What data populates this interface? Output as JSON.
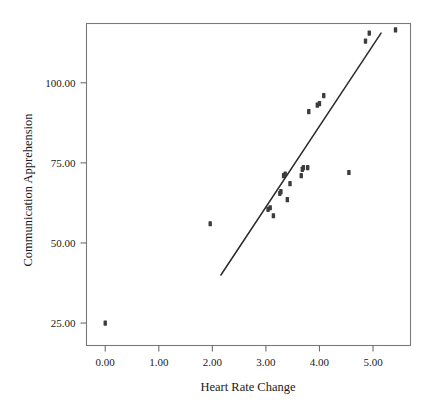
{
  "chart_data": {
    "type": "scatter",
    "title": "",
    "xlabel": "Heart Rate Change",
    "ylabel": "Communication Apprehension",
    "xlim": [
      -0.35,
      5.7
    ],
    "ylim": [
      18.0,
      118.5
    ],
    "xticks": [
      0,
      1,
      2,
      3,
      4,
      5
    ],
    "xticklabels": [
      "0.00",
      "1.00",
      "2.00",
      "3.00",
      "4.00",
      "5.00"
    ],
    "yticks": [
      25,
      50,
      75,
      100
    ],
    "yticklabels": [
      "25.00",
      "50.00",
      "75.00",
      "100.00"
    ],
    "grid": false,
    "legend": null,
    "marker": "filled-square",
    "points": [
      {
        "x": 0.0,
        "y": 25.0
      },
      {
        "x": 1.96,
        "y": 56.0
      },
      {
        "x": 3.04,
        "y": 60.5
      },
      {
        "x": 3.08,
        "y": 61.0
      },
      {
        "x": 3.14,
        "y": 58.5
      },
      {
        "x": 3.26,
        "y": 65.5
      },
      {
        "x": 3.28,
        "y": 66.0
      },
      {
        "x": 3.33,
        "y": 71.0
      },
      {
        "x": 3.36,
        "y": 71.5
      },
      {
        "x": 3.4,
        "y": 63.5
      },
      {
        "x": 3.45,
        "y": 68.5
      },
      {
        "x": 3.66,
        "y": 71.0
      },
      {
        "x": 3.68,
        "y": 73.0
      },
      {
        "x": 3.7,
        "y": 73.5
      },
      {
        "x": 3.78,
        "y": 73.5
      },
      {
        "x": 3.8,
        "y": 91.0
      },
      {
        "x": 3.96,
        "y": 93.0
      },
      {
        "x": 4.0,
        "y": 93.5
      },
      {
        "x": 4.08,
        "y": 96.0
      },
      {
        "x": 4.55,
        "y": 72.0
      },
      {
        "x": 4.86,
        "y": 113.0
      },
      {
        "x": 4.93,
        "y": 115.5
      },
      {
        "x": 5.42,
        "y": 116.5
      }
    ],
    "fit_line": {
      "label": "linear-fit",
      "x_start": 2.16,
      "y_start": 40.0,
      "x_end": 5.15,
      "y_end": 115.5
    }
  }
}
